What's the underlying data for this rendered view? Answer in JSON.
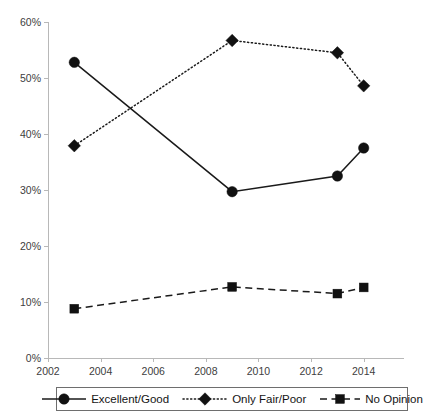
{
  "chart_data": {
    "type": "line",
    "title": "",
    "subtitle": "",
    "xlabel": "",
    "ylabel": "",
    "xlim": [
      2002,
      2015
    ],
    "ylim": [
      0,
      60
    ],
    "grid": false,
    "legend_position": "bottom",
    "x": [
      2003,
      2009,
      2013,
      2014
    ],
    "xticks": [
      "2002",
      "2004",
      "2006",
      "2008",
      "2010",
      "2012",
      "2014"
    ],
    "xtick_values": [
      2002,
      2004,
      2006,
      2008,
      2010,
      2012,
      2014
    ],
    "yticks": [
      "0%",
      "10%",
      "20%",
      "30%",
      "40%",
      "50%",
      "60%"
    ],
    "ytick_values": [
      0,
      10,
      20,
      30,
      40,
      50,
      60
    ],
    "series": [
      {
        "name": "Excellent/Good",
        "marker": "circle",
        "linestyle": "solid",
        "color": "#111111",
        "x": [
          2003,
          2009,
          2013,
          2014
        ],
        "values": [
          52.8,
          29.7,
          32.5,
          37.5
        ]
      },
      {
        "name": "Only Fair/Poor",
        "marker": "diamond",
        "linestyle": "dotted",
        "color": "#111111",
        "x": [
          2003,
          2009,
          2013,
          2014
        ],
        "values": [
          37.9,
          56.7,
          54.5,
          48.6
        ]
      },
      {
        "name": "No Opinion",
        "marker": "square",
        "linestyle": "dashed",
        "color": "#111111",
        "x": [
          2003,
          2009,
          2013,
          2014
        ],
        "values": [
          8.8,
          12.7,
          11.5,
          12.6
        ]
      }
    ]
  },
  "legend": {
    "entries": [
      {
        "label": "Excellent/Good"
      },
      {
        "label": "Only Fair/Poor"
      },
      {
        "label": "No Opinion"
      }
    ]
  }
}
